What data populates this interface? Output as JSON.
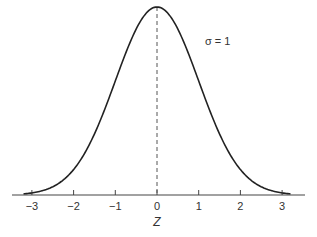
{
  "chart_data": {
    "type": "line",
    "title": "",
    "xlabel": "Z",
    "ylabel": "",
    "xlim": [
      -3.3,
      3.5
    ],
    "ticks": [
      -3,
      -2,
      -1,
      0,
      1,
      2,
      3
    ],
    "tick_labels": [
      "−3",
      "−2",
      "−1",
      "0",
      "1",
      "2",
      "3"
    ],
    "series": [
      {
        "name": "Standard normal density",
        "mean": 0,
        "sigma": 1,
        "x_range": [
          -3.2,
          3.2
        ]
      }
    ],
    "annotations": [
      {
        "text": "σ = 1",
        "x": 1.1,
        "y_rel": 0.8
      }
    ],
    "reference_lines": [
      {
        "type": "vertical",
        "x": 0,
        "style": "dashed"
      }
    ],
    "grid": false,
    "legend": "none"
  }
}
